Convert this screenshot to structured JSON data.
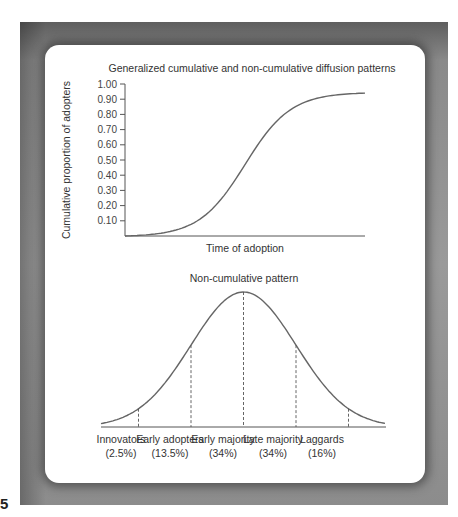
{
  "page_number": "5",
  "colors": {
    "frame_gray": "#8a8a8a",
    "curve": "#666666",
    "axis": "#555555",
    "text": "#333333",
    "card": "#ffffff"
  },
  "top_chart": {
    "title": "Generalized cumulative and non-cumulative diffusion patterns",
    "ylabel": "Cumulative proportion of adopters",
    "xlabel": "Time of adoption",
    "yticks": [
      "1.00",
      "0.90",
      "0.80",
      "0.70",
      "0.60",
      "0.50",
      "0.40",
      "0.30",
      "0.20",
      "0.10"
    ]
  },
  "bottom_chart": {
    "title": "Non-cumulative pattern",
    "categories": [
      {
        "name": "Innovators",
        "pct": "(2.5%)"
      },
      {
        "name": "Early adopters",
        "pct": "(13.5%)"
      },
      {
        "name": "Early majority",
        "pct": "(34%)"
      },
      {
        "name": "Late majority",
        "pct": "(34%)"
      },
      {
        "name": "Laggards",
        "pct": "(16%)"
      }
    ]
  },
  "chart_data": [
    {
      "type": "line",
      "title": "Generalized cumulative and non-cumulative diffusion patterns",
      "xlabel": "Time of adoption",
      "ylabel": "Cumulative proportion of adopters",
      "ylim": [
        0,
        1.0
      ],
      "yticks": [
        0.1,
        0.2,
        0.3,
        0.4,
        0.5,
        0.6,
        0.7,
        0.8,
        0.9,
        1.0
      ],
      "grid": false,
      "series": [
        {
          "name": "Cumulative adoption (S-curve)",
          "x": [
            0,
            0.1,
            0.2,
            0.3,
            0.4,
            0.5,
            0.6,
            0.7,
            0.8,
            0.9,
            1.0
          ],
          "values": [
            0.0,
            0.01,
            0.04,
            0.12,
            0.25,
            0.42,
            0.62,
            0.78,
            0.88,
            0.93,
            0.94
          ]
        }
      ]
    },
    {
      "type": "area",
      "title": "Non-cumulative pattern",
      "xlabel": "",
      "ylabel": "",
      "grid": false,
      "distribution": "normal",
      "dividers_in_sd": [
        -2,
        -1,
        0,
        1,
        2
      ],
      "categories": [
        "Innovators",
        "Early adopters",
        "Early majority",
        "Late majority",
        "Laggards"
      ],
      "values": [
        2.5,
        13.5,
        34,
        34,
        16
      ],
      "unit": "%"
    }
  ]
}
